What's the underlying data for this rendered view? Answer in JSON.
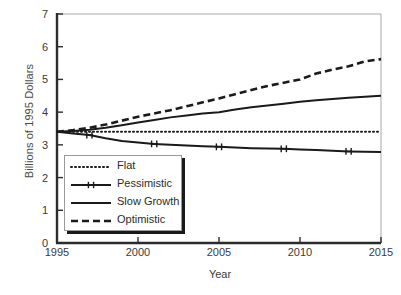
{
  "chart_data": {
    "type": "line",
    "title": "",
    "xlabel": "Year",
    "ylabel": "Billions of 1995 Dollars",
    "xlim": [
      1995,
      2015
    ],
    "ylim": [
      0,
      7
    ],
    "xticks": [
      1995,
      2000,
      2005,
      2010,
      2015
    ],
    "yticks": [
      0,
      1,
      2,
      3,
      4,
      5,
      6,
      7
    ],
    "grid": false,
    "legend_position": "lower-left-inside",
    "x": [
      1995,
      1996,
      1997,
      1998,
      1999,
      2000,
      2001,
      2002,
      2003,
      2004,
      2005,
      2006,
      2007,
      2008,
      2009,
      2010,
      2011,
      2012,
      2013,
      2014,
      2015
    ],
    "series": [
      {
        "name": "Flat",
        "style": "dotted",
        "values": [
          3.4,
          3.4,
          3.4,
          3.4,
          3.4,
          3.4,
          3.4,
          3.4,
          3.4,
          3.4,
          3.4,
          3.4,
          3.4,
          3.4,
          3.4,
          3.4,
          3.4,
          3.4,
          3.4,
          3.4,
          3.4
        ]
      },
      {
        "name": "Pessimistic",
        "style": "solid-marker",
        "markers_at": [
          1997,
          2001,
          2005,
          2009,
          2013
        ],
        "values": [
          3.4,
          3.35,
          3.3,
          3.2,
          3.12,
          3.07,
          3.03,
          3.0,
          2.98,
          2.96,
          2.94,
          2.92,
          2.9,
          2.89,
          2.88,
          2.86,
          2.84,
          2.82,
          2.8,
          2.79,
          2.78
        ]
      },
      {
        "name": "Slow Growth",
        "style": "solid",
        "values": [
          3.4,
          3.42,
          3.46,
          3.52,
          3.6,
          3.68,
          3.76,
          3.84,
          3.9,
          3.96,
          4.0,
          4.08,
          4.15,
          4.2,
          4.26,
          4.32,
          4.36,
          4.4,
          4.44,
          4.47,
          4.5
        ]
      },
      {
        "name": "Optimistic",
        "style": "dashed",
        "values": [
          3.4,
          3.45,
          3.52,
          3.62,
          3.74,
          3.86,
          3.96,
          4.06,
          4.18,
          4.3,
          4.42,
          4.55,
          4.68,
          4.8,
          4.9,
          5.0,
          5.18,
          5.3,
          5.4,
          5.55,
          5.62
        ]
      }
    ]
  },
  "axis": {
    "ylabel": "Billions of 1995 Dollars",
    "xlabel": "Year",
    "ytick_labels": [
      "0",
      "1",
      "2",
      "3",
      "4",
      "5",
      "6",
      "7"
    ],
    "xtick_labels": [
      "1995",
      "2000",
      "2005",
      "2010",
      "2015"
    ]
  },
  "legend": {
    "items": [
      {
        "label": "Flat"
      },
      {
        "label": "Pessimistic"
      },
      {
        "label": "Slow Growth"
      },
      {
        "label": "Optimistic"
      }
    ]
  },
  "colors": {
    "line": "#1a1a1a",
    "axis": "#2b2b2b",
    "frame": "#a8a8a8",
    "text": "#3a3a3a",
    "background": "#ffffff"
  }
}
